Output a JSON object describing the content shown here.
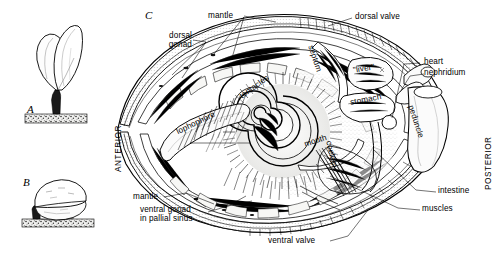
{
  "figure": {
    "style": "pen-and-ink stipple scientific illustration",
    "background": "#ffffff",
    "ink": "#000000",
    "panels": [
      {
        "id": "A",
        "letter": "A",
        "description": "pedunculate brachiopod attached upright to substrate by long peduncle"
      },
      {
        "id": "B",
        "letter": "B",
        "description": "brachiopod resting close to substrate attached by short peduncle"
      },
      {
        "id": "C",
        "letter": "C",
        "description": "sagittal section of brachiopod showing internal organs"
      }
    ]
  },
  "orientation": {
    "anterior": "ANTERIOR",
    "posterior": "POSTERIOR"
  },
  "labels": {
    "mantle_top": "mantle",
    "dorsal_gonad": "dorsal\ngonad",
    "dorsal_gonad_line1": "dorsal",
    "dorsal_gonad_line2": "gonad",
    "dorsal_valve": "dorsal valve",
    "heart": "heart",
    "nephridium": "nephridium",
    "liver": "\"liver\"",
    "stomach": "stomach",
    "septum": "septum",
    "peduncle": "peduncle",
    "lophophore": "lophophore",
    "tentacles": "tentacles",
    "mouth": "mouth",
    "coelom": "coelom",
    "intestine": "intestine",
    "muscles": "muscles",
    "mantle_bottom": "mantle",
    "ventral_gonad_line1": "ventral gonad",
    "ventral_gonad_line2": "in pallial sinus",
    "ventral_valve": "ventral valve"
  },
  "colors": {
    "ink": "#000000",
    "paper": "#ffffff",
    "tint_light": "#f2f2f0",
    "tint_mid": "#d8d8d4",
    "substrate": "#3a3a3a"
  }
}
